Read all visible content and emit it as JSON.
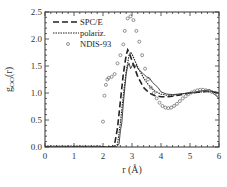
{
  "chart_data": {
    "type": "line",
    "title": "",
    "xlabel": "r (Å)",
    "ylabel": "g_OO(r)",
    "ylabel_main": "g",
    "ylabel_sub": "OO",
    "ylabel_tail": "(r)",
    "xlim": [
      0,
      6
    ],
    "ylim": [
      0,
      2.5
    ],
    "xticks": [
      "0",
      "1",
      "2",
      "3",
      "4",
      "5",
      "6"
    ],
    "yticks": [
      "0.0",
      "0.5",
      "1.0",
      "1.5",
      "2.0",
      "2.5"
    ],
    "grid": false,
    "legend_position": "top-left",
    "series": [
      {
        "name": "SPC/E",
        "style": "dashed",
        "x": [
          0,
          2.3,
          2.4,
          2.5,
          2.6,
          2.7,
          2.8,
          2.85,
          2.9,
          3.0,
          3.1,
          3.2,
          3.3,
          3.4,
          3.5,
          3.6,
          3.7,
          3.8,
          4.0,
          4.2,
          4.4,
          4.6,
          4.8,
          5.0,
          5.2,
          5.4,
          5.6,
          5.8,
          6.0
        ],
        "y": [
          0,
          0,
          0.05,
          0.35,
          0.85,
          1.35,
          1.7,
          1.8,
          1.75,
          1.6,
          1.45,
          1.3,
          1.2,
          1.1,
          1.05,
          1.0,
          0.97,
          0.95,
          0.93,
          0.93,
          0.94,
          0.96,
          0.98,
          1.0,
          1.01,
          1.02,
          1.03,
          1.02,
          1.0
        ]
      },
      {
        "name": "polariz.",
        "style": "dotted",
        "x": [
          0,
          2.4,
          2.5,
          2.6,
          2.7,
          2.8,
          2.9,
          2.95,
          3.0,
          3.1,
          3.2,
          3.3,
          3.4,
          3.5,
          3.6,
          3.7,
          3.8,
          4.0,
          4.2,
          4.4,
          4.6,
          4.8,
          5.0,
          5.2,
          5.4,
          5.6,
          5.8,
          6.0
        ],
        "y": [
          0,
          0,
          0.05,
          0.45,
          0.95,
          1.4,
          1.7,
          1.76,
          1.72,
          1.6,
          1.48,
          1.38,
          1.28,
          1.2,
          1.13,
          1.08,
          1.03,
          0.98,
          0.96,
          0.96,
          0.97,
          0.99,
          1.0,
          1.01,
          1.02,
          1.03,
          1.02,
          1.0
        ]
      },
      {
        "name": "solid-simulation",
        "style": "solid",
        "x": [
          0,
          2.45,
          2.55,
          2.6,
          2.65,
          2.7,
          2.75,
          2.8,
          2.85,
          2.9,
          2.95,
          3.0,
          3.05,
          3.1,
          3.15,
          3.2,
          3.3,
          3.4,
          3.5,
          3.6,
          3.7,
          3.8,
          3.9,
          4.0,
          4.2,
          4.4,
          4.6,
          4.8,
          5.0,
          5.2,
          5.4,
          5.6,
          5.7,
          5.8,
          5.9,
          6.0
        ],
        "y": [
          0,
          0,
          0.05,
          0.3,
          0.45,
          0.8,
          1.1,
          1.35,
          1.5,
          1.55,
          1.45,
          1.5,
          1.55,
          1.48,
          1.52,
          1.45,
          1.4,
          1.35,
          1.3,
          1.28,
          1.2,
          1.15,
          1.1,
          1.02,
          0.98,
          0.97,
          0.98,
          0.99,
          1.0,
          1.02,
          1.04,
          1.05,
          1.06,
          1.0,
          0.95,
          0.9
        ]
      },
      {
        "name": "NDIS-93",
        "style": "circles",
        "x": [
          0,
          0.1,
          0.2,
          0.3,
          0.4,
          0.5,
          0.6,
          0.7,
          0.8,
          0.9,
          1.0,
          1.1,
          1.2,
          1.3,
          1.4,
          1.5,
          1.6,
          1.7,
          1.8,
          1.9,
          2.0,
          2.05,
          2.1,
          2.15,
          2.2,
          2.3,
          2.4,
          2.5,
          2.6,
          2.7,
          2.75,
          2.85,
          2.95,
          3.05,
          3.15,
          3.25,
          3.35,
          3.45,
          3.55,
          3.65,
          3.75,
          3.85,
          3.95,
          4.05,
          4.15,
          4.25,
          4.35,
          4.45,
          4.55,
          4.65,
          4.75,
          4.85,
          4.95,
          5.05,
          5.15,
          5.25,
          5.35,
          5.45,
          5.55,
          5.65,
          5.75,
          5.85,
          5.95
        ],
        "y": [
          0,
          0,
          0,
          0,
          0,
          0,
          0,
          0,
          0,
          0,
          0,
          0,
          0,
          0,
          0,
          0,
          0,
          0,
          0,
          0,
          0.47,
          0.95,
          1.15,
          1.25,
          1.28,
          1.3,
          1.35,
          1.55,
          1.7,
          1.9,
          2.15,
          2.38,
          2.42,
          2.35,
          2.15,
          1.95,
          1.7,
          1.45,
          1.25,
          1.1,
          1.0,
          0.9,
          0.82,
          0.76,
          0.73,
          0.72,
          0.73,
          0.76,
          0.8,
          0.85,
          0.9,
          0.94,
          0.98,
          1.01,
          1.03,
          1.05,
          1.06,
          1.06,
          1.05,
          1.04,
          1.02,
          1.0,
          0.97
        ]
      }
    ],
    "legend": [
      {
        "label": "SPC/E",
        "style": "dashed"
      },
      {
        "label": "polariz.",
        "style": "dotted"
      },
      {
        "label": "NDIS-93",
        "style": "circles"
      }
    ]
  }
}
